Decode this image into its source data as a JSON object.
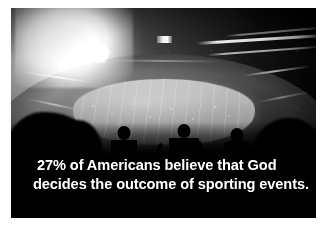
{
  "image": {
    "kind": "photograph",
    "subject": "night-stadium-crowd",
    "palette": "grayscale",
    "background_color": "#ffffff",
    "photo_background_color": "#050505",
    "caption_color": "#ffffff",
    "field_color": "#b2b2b2",
    "flare_color": "#ffffff"
  },
  "caption": {
    "line1": "27% of Americans believe that God",
    "line2": "decides the outcome of sporting events.",
    "full_text": "27% of Americans believe that God decides the outcome of sporting events.",
    "statistic": "27%"
  },
  "scene": {
    "light_source": "stadium-floodlight-flare",
    "field": "football-pitch",
    "foreground": "cheering-crowd-silhouettes",
    "arms_raised_count": 8
  }
}
